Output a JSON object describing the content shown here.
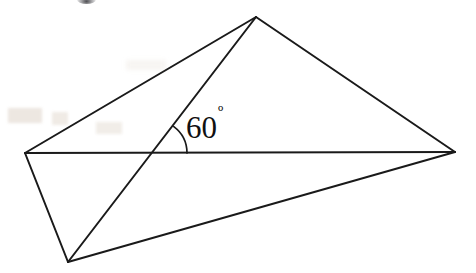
{
  "figure": {
    "kind": "geometry-diagram",
    "width": 476,
    "height": 273,
    "background_color": "#ffffff",
    "stroke_color": "#1a1a1a",
    "stroke_width": 2
  },
  "annotation": {
    "angle_value": "60",
    "degree_symbol": "º",
    "full_label": "60º",
    "label_x": 186,
    "label_y": 138,
    "text_color": "#111111"
  },
  "points": {
    "apex": {
      "name": "apex",
      "x": 256,
      "y": 17
    },
    "left": {
      "name": "left-vertex",
      "x": 25,
      "y": 153
    },
    "right": {
      "name": "right-vertex",
      "x": 455,
      "y": 152
    },
    "bottom": {
      "name": "bottom-vertex",
      "x": 68,
      "y": 262
    },
    "intersection": {
      "name": "intersection",
      "x": 154,
      "y": 153
    }
  },
  "segments": [
    {
      "name": "apex-to-left",
      "x1": 256,
      "y1": 17,
      "x2": 25,
      "y2": 153
    },
    {
      "name": "apex-to-right",
      "x1": 256,
      "y1": 17,
      "x2": 455,
      "y2": 152
    },
    {
      "name": "apex-to-bottom",
      "x1": 256,
      "y1": 17,
      "x2": 68,
      "y2": 262
    },
    {
      "name": "left-to-right",
      "x1": 25,
      "y1": 153,
      "x2": 455,
      "y2": 152
    },
    {
      "name": "left-to-bottom",
      "x1": 25,
      "y1": 153,
      "x2": 68,
      "y2": 262
    },
    {
      "name": "bottom-to-right",
      "x1": 68,
      "y1": 262,
      "x2": 455,
      "y2": 152
    }
  ],
  "angle_arc": {
    "name": "angle-arc-60",
    "center_x": 154,
    "center_y": 153,
    "radius": 33,
    "path": "M 187 152 A 33 33 0 0 0 179 132"
  },
  "artifacts": {
    "top_blob": "scan-smudge-top",
    "left_marks": "faint-scan-marks-left"
  }
}
